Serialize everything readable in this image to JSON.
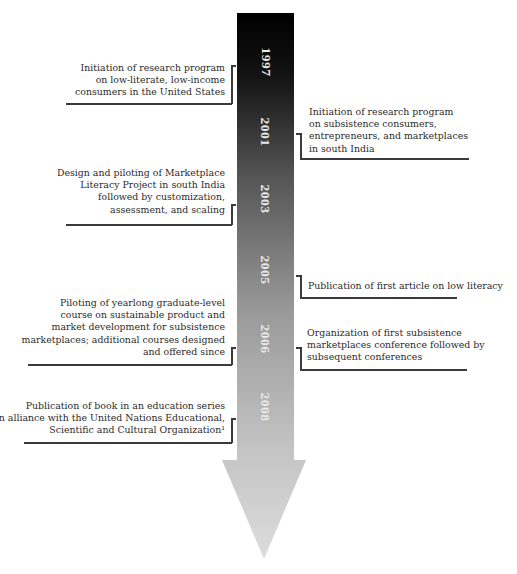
{
  "diagram": {
    "type": "vertical timeline arrow",
    "arrow_gradient": {
      "top": "#000000",
      "bottom": "#d8d8d8"
    },
    "line_color": "#3a3a3a",
    "year_text_color": "#e8e8e8"
  },
  "years": [
    "1997",
    "2001",
    "2003",
    "2005",
    "2006",
    "2008"
  ],
  "events": [
    {
      "year": "1997",
      "side": "left",
      "text": [
        "Initiation of research program",
        "on low-literate, low-income",
        "consumers in the United States"
      ]
    },
    {
      "year": "2001",
      "side": "right",
      "text": [
        "Initiation of research program",
        "on subsistence consumers,",
        "entrepreneurs, and marketplaces",
        "in south India"
      ]
    },
    {
      "year": "2003",
      "side": "left",
      "text": [
        "Design and piloting of Marketplace",
        "Literacy Project in south India",
        "followed by customization,",
        "assessment, and scaling"
      ]
    },
    {
      "year": "2005",
      "side": "right",
      "text": [
        "Publication of first article on low literacy"
      ]
    },
    {
      "year": "2006",
      "side": "left",
      "text": [
        "Piloting of yearlong graduate-level",
        "course on sustainable product and",
        "market development for subsistence",
        "marketplaces; additional courses designed",
        "and offered since"
      ]
    },
    {
      "year": "2006",
      "side": "right",
      "text": [
        "Organization of first subsistence",
        "marketplaces conference followed by",
        "subsequent conferences"
      ]
    },
    {
      "year": "2008",
      "side": "left",
      "text": [
        "Publication of book in an education series",
        "in alliance with the United Nations Educational,",
        "Scientific and Cultural Organization¹"
      ]
    }
  ]
}
